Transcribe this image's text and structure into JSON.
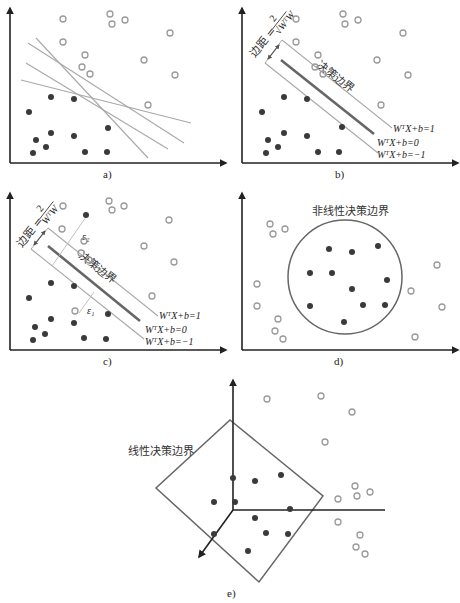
{
  "figure": {
    "panels": [
      {
        "id": "a",
        "caption": "a)"
      },
      {
        "id": "b",
        "caption": "b)",
        "margin_label": "边距 = ",
        "margin_formula_num": "2",
        "margin_formula_den": "√WᵀW",
        "boundary_label": "决策边界",
        "eq_plus": "WᵀX+b=1",
        "eq_zero": "WᵀX+b=0",
        "eq_minus": "WᵀX+b=−1"
      },
      {
        "id": "c",
        "caption": "c)",
        "margin_label": "边距 = ",
        "margin_formula_num": "2",
        "margin_formula_den": "WᵀW",
        "boundary_label": "决策边界",
        "slack_1": "ε₁",
        "slack_2": "ε₂",
        "eq_plus": "WᵀX+b=1",
        "eq_zero": "WᵀX+b=0",
        "eq_minus": "WᵀX+b=−1"
      },
      {
        "id": "d",
        "caption": "d)",
        "boundary_label": "非线性决策边界"
      },
      {
        "id": "e",
        "caption": "e)",
        "boundary_label": "线性决策边界"
      }
    ]
  },
  "colors": {
    "axis": "#222222",
    "filled_point": "#3a3a3a",
    "hollow_point": "#9a9a9a",
    "boundary_thin": "#a8a8a8",
    "boundary_thick": "#666666",
    "circle": "#666666"
  }
}
